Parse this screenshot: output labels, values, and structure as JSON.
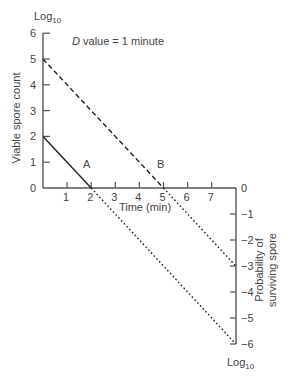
{
  "chart_data": {
    "type": "line",
    "title": "",
    "annotation": {
      "italic": "D",
      "text": " value = 1 minute"
    },
    "xlabel": "Time (min)",
    "ylabel_left": "Viable spore count",
    "ylabel_right": [
      "Probability of",
      "surviving spore"
    ],
    "left_unit": "Log",
    "left_unit_sub": "10",
    "right_unit": "Log",
    "right_unit_sub": "10",
    "xlim": [
      0,
      8
    ],
    "ylim_left": [
      0,
      6
    ],
    "ylim_right": [
      -6,
      0
    ],
    "x_ticks": [
      "1",
      "2",
      "3",
      "4",
      "5",
      "6",
      "7"
    ],
    "y_ticks_left": [
      "0",
      "1",
      "2",
      "3",
      "4",
      "5",
      "6"
    ],
    "y_ticks_right": [
      "0",
      "−1",
      "−2",
      "−3",
      "−4",
      "−5",
      "−6"
    ],
    "grid": false,
    "series": [
      {
        "name": "A",
        "measured": {
          "x": [
            0,
            2
          ],
          "y": [
            2,
            0
          ],
          "style": "solid"
        },
        "extrapolated": {
          "x": [
            2,
            8
          ],
          "y": [
            0,
            -6
          ],
          "style": "dotted"
        }
      },
      {
        "name": "B",
        "measured": {
          "x": [
            0,
            5
          ],
          "y": [
            5,
            0
          ],
          "style": "dashed"
        },
        "extrapolated": {
          "x": [
            5,
            8
          ],
          "y": [
            0,
            -3
          ],
          "style": "dotted"
        }
      }
    ],
    "colors": {
      "axis": "#555555",
      "line": "#222222",
      "text": "#444444"
    }
  }
}
